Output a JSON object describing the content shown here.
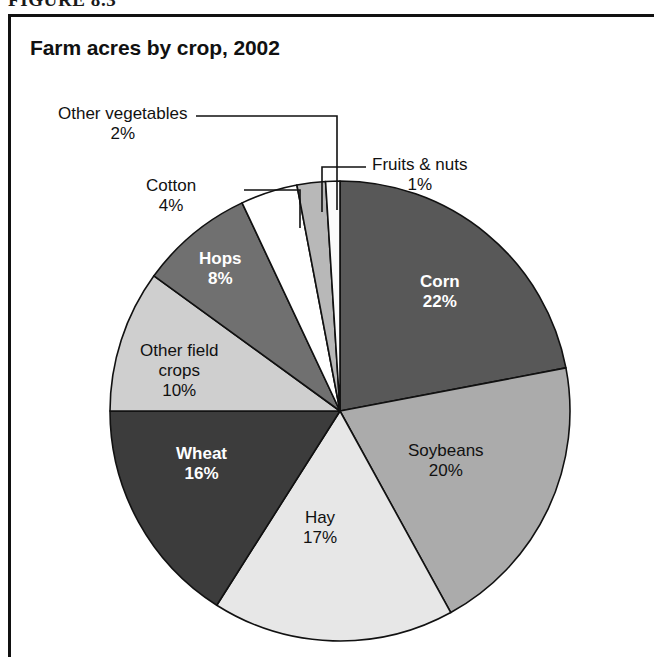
{
  "figure": {
    "caption": "FIGURE 8.3",
    "title": "Farm acres by crop, 2002"
  },
  "chart_data": {
    "type": "pie",
    "title": "Farm acres by crop, 2002",
    "xlabel": "",
    "ylabel": "",
    "units": "percent",
    "legend_position": "none",
    "grid": false,
    "start_angle_deg": 0,
    "direction": "clockwise",
    "categories": [
      "Corn",
      "Soybeans",
      "Hay",
      "Wheat",
      "Other field crops",
      "Hops",
      "Cotton",
      "Other vegetables",
      "Fruits & nuts"
    ],
    "values": [
      22,
      20,
      17,
      16,
      10,
      8,
      4,
      2,
      1
    ],
    "value_labels": [
      "22%",
      "20%",
      "17%",
      "16%",
      "10%",
      "8%",
      "4%",
      "2%",
      "1%"
    ],
    "slices": [
      {
        "label": "Corn",
        "value": 22,
        "value_label": "22%",
        "color": "#585858",
        "text_color": "#ffffff",
        "label_placement": "inside"
      },
      {
        "label": "Soybeans",
        "value": 20,
        "value_label": "20%",
        "color": "#ababab",
        "text_color": "#111111",
        "label_placement": "inside"
      },
      {
        "label": "Hay",
        "value": 17,
        "value_label": "17%",
        "color": "#e7e7e7",
        "text_color": "#111111",
        "label_placement": "inside"
      },
      {
        "label": "Wheat",
        "value": 16,
        "value_label": "16%",
        "color": "#3c3c3c",
        "text_color": "#ffffff",
        "label_placement": "inside"
      },
      {
        "label": "Other field crops",
        "value": 10,
        "value_label": "10%",
        "color": "#cfcfcf",
        "text_color": "#111111",
        "label_placement": "inside"
      },
      {
        "label": "Hops",
        "value": 8,
        "value_label": "8%",
        "color": "#707070",
        "text_color": "#ffffff",
        "label_placement": "inside"
      },
      {
        "label": "Cotton",
        "value": 4,
        "value_label": "4%",
        "color": "#ffffff",
        "text_color": "#111111",
        "label_placement": "callout"
      },
      {
        "label": "Other vegetables",
        "value": 2,
        "value_label": "2%",
        "color": "#b8b8b8",
        "text_color": "#111111",
        "label_placement": "callout"
      },
      {
        "label": "Fruits & nuts",
        "value": 1,
        "value_label": "1%",
        "color": "#fbfbfb",
        "text_color": "#111111",
        "label_placement": "callout"
      }
    ]
  },
  "labels": {
    "corn": {
      "name": "Corn",
      "pct": "22%"
    },
    "soybeans": {
      "name": "Soybeans",
      "pct": "20%"
    },
    "hay": {
      "name": "Hay",
      "pct": "17%"
    },
    "wheat": {
      "name": "Wheat",
      "pct": "16%"
    },
    "other_field_crops": {
      "name_line1": "Other field",
      "name_line2": "crops",
      "pct": "10%"
    },
    "hops": {
      "name": "Hops",
      "pct": "8%"
    },
    "cotton": {
      "name": "Cotton",
      "pct": "4%"
    },
    "other_vegetables": {
      "name": "Other vegetables",
      "pct": "2%"
    },
    "fruits_nuts": {
      "name": "Fruits & nuts",
      "pct": "1%"
    }
  },
  "style": {
    "slice_outline": "#111111",
    "background": "#ffffff",
    "border": "#111111"
  }
}
